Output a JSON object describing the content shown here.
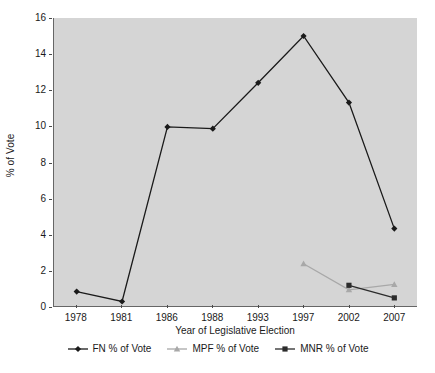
{
  "chart_data": {
    "type": "line",
    "title": "",
    "xlabel": "Year of Legislative Election",
    "ylabel": "% of Vote",
    "categories": [
      "1978",
      "1981",
      "1986",
      "1988",
      "1993",
      "1997",
      "2002",
      "2007"
    ],
    "ylim": [
      0,
      16
    ],
    "yticks": [
      0,
      2,
      4,
      6,
      8,
      10,
      12,
      14,
      16
    ],
    "ytick_labels": [
      "0",
      "2",
      "4",
      "6",
      "8",
      "10",
      "12",
      "14",
      "16"
    ],
    "grid": false,
    "legend_position": "bottom",
    "series": [
      {
        "name": "FN % of Vote",
        "color": "#1a1a1a",
        "marker": "diamond",
        "values": [
          0.8,
          0.25,
          9.95,
          9.85,
          12.4,
          15.0,
          11.3,
          4.3
        ]
      },
      {
        "name": "MPF % of Vote",
        "color": "#a8a8a8",
        "marker": "triangle",
        "values": [
          null,
          null,
          null,
          null,
          null,
          2.35,
          0.9,
          1.2
        ]
      },
      {
        "name": "MNR % of Vote",
        "color": "#2b2b2b",
        "marker": "square",
        "values": [
          null,
          null,
          null,
          null,
          null,
          null,
          1.15,
          0.45
        ]
      }
    ]
  },
  "colors": {
    "plot_background": "#d5d5d5",
    "figure_background": "#ffffff",
    "axis": "#666666",
    "text": "#1a1a1a"
  }
}
